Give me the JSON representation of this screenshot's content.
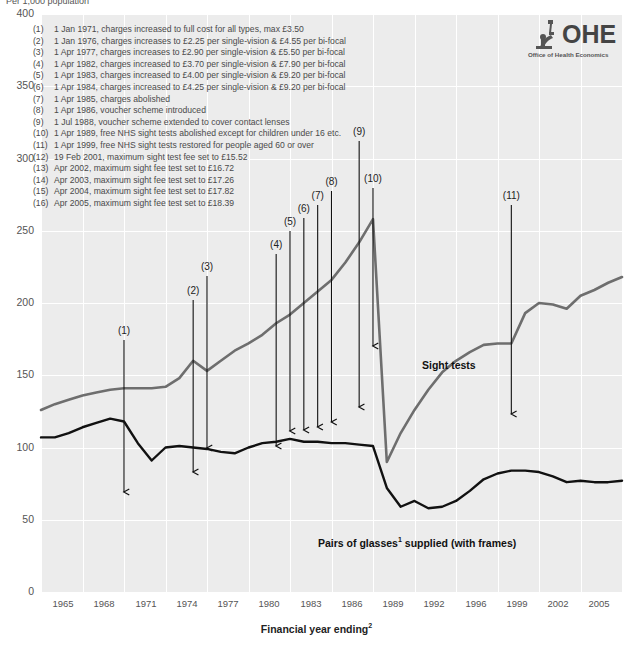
{
  "axes": {
    "ylabel_top": "Per 1,000 population",
    "xlabel": "Financial year ending",
    "xlabel_sup": "2",
    "yticks": [
      "400",
      "350",
      "300",
      "250",
      "200",
      "150",
      "100",
      "50",
      "0"
    ],
    "xticks": [
      "1965",
      "1968",
      "1971",
      "1974",
      "1977",
      "1980",
      "1983",
      "1986",
      "1989",
      "1992",
      "1996",
      "1999",
      "2002",
      "2005"
    ]
  },
  "logo": {
    "name": "OHE",
    "subtitle": "Office of Health Economics",
    "icon": "microscope-icon"
  },
  "series_labels": {
    "sight_tests": "Sight tests",
    "glasses": "Pairs of glasses",
    "glasses_sup": "1",
    "glasses_rest": " supplied (with frames)"
  },
  "notes": [
    {
      "num": "(1)",
      "text": "1 Jan 1971, charges increased to full cost for all types, max £3.50"
    },
    {
      "num": "(2)",
      "text": "1 Jan 1976, charges increases to £2.25 per single-vision & £4.55 per bi-focal"
    },
    {
      "num": "(3)",
      "text": "1 Apr 1977, charges increases to £2.90 per single-vision & £5.50 per bi-focal"
    },
    {
      "num": "(4)",
      "text": "1 Apr 1982, charges increased to £3.70 per single-vision & £7.90 per bi-focal"
    },
    {
      "num": "(5)",
      "text": "1 Apr 1983, charges increased to £4.00 per single-vision & £9.20 per bi-focal"
    },
    {
      "num": "(6)",
      "text": "1 Apr 1984, charges increased to £4.25 per single-vision & £9.20 per bi-focal"
    },
    {
      "num": "(7)",
      "text": "1 Apr 1985, charges abolished"
    },
    {
      "num": "(8)",
      "text": "1 Apr 1986, voucher scheme introduced"
    },
    {
      "num": "(9)",
      "text": "1 Jul 1988, voucher scheme extended to cover contact lenses"
    },
    {
      "num": "(10)",
      "text": "1 Apr 1989, free NHS sight tests abolished except for children under 16 etc."
    },
    {
      "num": "(11)",
      "text": "1 Apr 1999, free NHS sight tests restored for people aged 60 or over"
    },
    {
      "num": "(12)",
      "text": "19 Feb 2001, maximum sight test fee set to £15.52"
    },
    {
      "num": "(13)",
      "text": "Apr 2002, maximum sight fee test set to £16.72"
    },
    {
      "num": "(14)",
      "text": "Apr 2003, maximum sight fee test set to £17.26"
    },
    {
      "num": "(15)",
      "text": "Apr 2004, maximum sight fee test set to £17.82"
    },
    {
      "num": "(16)",
      "text": "Apr 2005, maximum sight fee test set to £18.39"
    }
  ],
  "annotation_arrows": [
    {
      "label": "(1)",
      "x": 1971,
      "label_y": 330,
      "tip_y": 152
    },
    {
      "label": "(2)",
      "x": 1976,
      "label_y": 290,
      "tip_y": 172
    },
    {
      "label": "(3)",
      "x": 1977,
      "label_y": 266,
      "tip_y": 172
    },
    {
      "label": "(4)",
      "x": 1982,
      "label_y": 244,
      "tip_y": 192
    },
    {
      "label": "(5)",
      "x": 1983,
      "label_y": 221,
      "tip_y": 200
    },
    {
      "label": "(6)",
      "x": 1984,
      "label_y": 208,
      "tip_y": 212
    },
    {
      "label": "(7)",
      "x": 1985,
      "label_y": 195,
      "tip_y": 222
    },
    {
      "label": "(8)",
      "x": 1986,
      "label_y": 181,
      "tip_y": 231
    },
    {
      "label": "(9)",
      "x": 1988,
      "label_y": 131,
      "tip_y": 266
    },
    {
      "label": "(10)",
      "x": 1989,
      "label_y": 178,
      "tip_y": 158
    },
    {
      "label": "(11)",
      "x": 1999,
      "label_y": 195,
      "tip_y": 209
    }
  ],
  "chart_data": {
    "type": "line",
    "title": "",
    "xlabel": "Financial year ending",
    "ylabel": "Per 1,000 population",
    "xlim": [
      1965,
      2007
    ],
    "ylim": [
      0,
      400
    ],
    "grid": true,
    "legend": "inline-labels",
    "x": [
      1965,
      1966,
      1967,
      1968,
      1969,
      1970,
      1971,
      1972,
      1973,
      1974,
      1975,
      1976,
      1977,
      1978,
      1979,
      1980,
      1981,
      1982,
      1983,
      1984,
      1985,
      1986,
      1987,
      1988,
      1989,
      1990,
      1991,
      1992,
      1993,
      1994,
      1995,
      1996,
      1997,
      1998,
      1999,
      2000,
      2001,
      2002,
      2003,
      2004,
      2005,
      2006,
      2007
    ],
    "series": [
      {
        "name": "Sight tests",
        "color": "#6e6e6e",
        "values": [
          126,
          130,
          133,
          136,
          138,
          140,
          141,
          141,
          141,
          142,
          148,
          160,
          153,
          160,
          167,
          172,
          178,
          186,
          192,
          200,
          208,
          216,
          228,
          242,
          258,
          90,
          110,
          126,
          140,
          152,
          160,
          166,
          171,
          172,
          172,
          193,
          200,
          199,
          196,
          205,
          209,
          214,
          218
        ]
      },
      {
        "name": "Pairs of glasses supplied (with frames)",
        "color": "#111111",
        "values": [
          107,
          107,
          110,
          114,
          117,
          120,
          118,
          103,
          91,
          100,
          101,
          100,
          99,
          97,
          96,
          100,
          103,
          104,
          106,
          104,
          104,
          103,
          103,
          102,
          101,
          72,
          59,
          63,
          58,
          59,
          63,
          70,
          78,
          82,
          84,
          84,
          83,
          80,
          76,
          77,
          76,
          76,
          77
        ]
      }
    ]
  }
}
